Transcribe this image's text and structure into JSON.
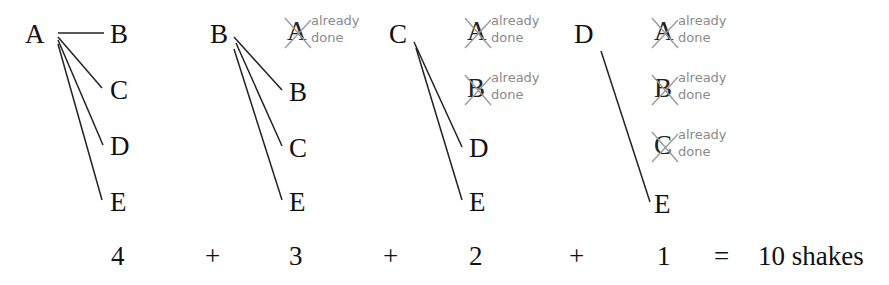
{
  "diagram": {
    "groups": [
      {
        "source": "A",
        "targets": [
          "B",
          "C",
          "D",
          "E"
        ],
        "already_done": []
      },
      {
        "source": "B",
        "targets": [
          "B",
          "C",
          "E"
        ],
        "already_done": [
          "A"
        ]
      },
      {
        "source": "C",
        "targets": [
          "D",
          "E"
        ],
        "already_done": [
          "A",
          "B"
        ]
      },
      {
        "source": "D",
        "targets": [
          "E"
        ],
        "already_done": [
          "A",
          "B",
          "C"
        ]
      }
    ],
    "already_done_note": "already\ndone",
    "equation": {
      "terms": [
        "4",
        "+",
        "3",
        "+",
        "2",
        "+",
        "1",
        "=",
        "10 shakes"
      ]
    },
    "colors": {
      "ink": "#111111",
      "note": "#8a8a8a",
      "cross": "#9a9a9a"
    }
  }
}
